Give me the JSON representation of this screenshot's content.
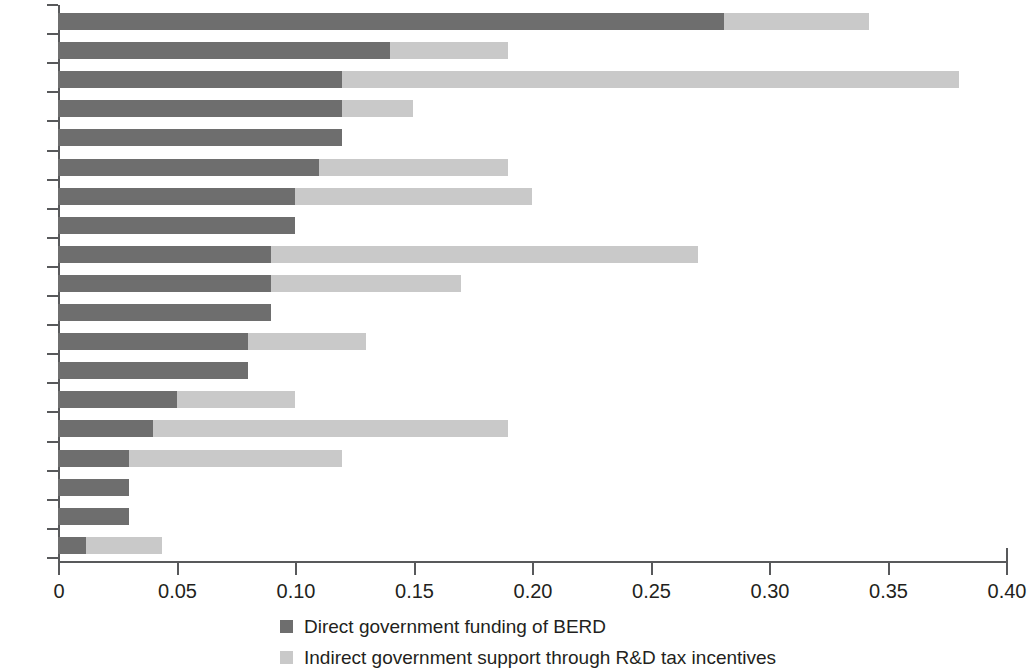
{
  "chart_data": {
    "type": "bar",
    "orientation": "horizontal",
    "stacked": true,
    "title": "",
    "subtitle": "",
    "xlabel": "",
    "ylabel": "",
    "xlim": [
      0,
      0.4
    ],
    "xticks": [
      0,
      0.05,
      0.1,
      0.15,
      0.2,
      0.25,
      0.3,
      0.35,
      0.4
    ],
    "xtick_labels": [
      "0",
      "0.05",
      "0.10",
      "0.15",
      "0.20",
      "0.25",
      "0.30",
      "0.35",
      "0.40"
    ],
    "grid": false,
    "legend_position": "bottom",
    "categories": [
      "SVN",
      "CZE",
      "FRA",
      "ESP",
      "SWE",
      "HUN",
      "AUT",
      "EST",
      "BEL",
      "GBR",
      "DEU",
      "NOR",
      "FIN",
      "DNK",
      "NLD",
      "PRT",
      "SVK",
      "POL",
      "HRV"
    ],
    "series": [
      {
        "name": "Direct government funding of BERD",
        "color": "#6e6e6e",
        "values": [
          0.281,
          0.14,
          0.12,
          0.12,
          0.12,
          0.11,
          0.1,
          0.1,
          0.09,
          0.09,
          0.09,
          0.08,
          0.08,
          0.05,
          0.04,
          0.03,
          0.03,
          0.03,
          0.012
        ]
      },
      {
        "name": "Indirect government support through R&D tax incentives",
        "color": "#c9c9c9",
        "values": [
          0.061,
          0.05,
          0.26,
          0.03,
          0.0,
          0.08,
          0.1,
          0.0,
          0.18,
          0.08,
          0.0,
          0.05,
          0.0,
          0.05,
          0.15,
          0.09,
          0.0,
          0.0,
          0.032
        ]
      }
    ],
    "totals": [
      0.342,
      0.19,
      0.38,
      0.15,
      0.12,
      0.19,
      0.2,
      0.1,
      0.27,
      0.17,
      0.09,
      0.13,
      0.08,
      0.1,
      0.19,
      0.12,
      0.03,
      0.03,
      0.044
    ]
  },
  "legend": {
    "items": [
      {
        "label": "Direct government funding of BERD",
        "swatch": "direct"
      },
      {
        "label": "Indirect government support through R&D tax incentives",
        "swatch": "indirect"
      }
    ]
  }
}
